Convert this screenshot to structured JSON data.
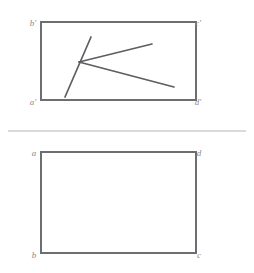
{
  "figure": {
    "background_color": "#ffffff",
    "line_color": "#6e6e72",
    "figure_color": "#5d5d62",
    "divider_color": "#b4b4b8",
    "label_color": "#8a8a8a"
  },
  "views": [
    {
      "name": "front-view",
      "label": "upper view",
      "rect": {
        "x": 41,
        "y": 22,
        "width": 155,
        "height": 78
      },
      "corner_labels": [
        {
          "key": "top_left",
          "text": "b'",
          "x": 33,
          "y": 24
        },
        {
          "key": "top_right",
          "text": "c'",
          "x": 198,
          "y": 24
        },
        {
          "key": "bottom_left",
          "text": "a'",
          "x": 33,
          "y": 103
        },
        {
          "key": "bottom_right",
          "text": "d'",
          "x": 198,
          "y": 103
        }
      ],
      "content_lines": [
        {
          "name": "stroke-diagonal",
          "x1": 91,
          "y1": 37,
          "x2": 65,
          "y2": 97
        },
        {
          "name": "stroke-upper-ray",
          "x1": 79,
          "y1": 62,
          "x2": 152,
          "y2": 44
        },
        {
          "name": "stroke-lower-ray",
          "x1": 79,
          "y1": 62,
          "x2": 174,
          "y2": 87
        }
      ]
    },
    {
      "name": "top-view",
      "label": "lower view",
      "rect": {
        "x": 41,
        "y": 152,
        "width": 155,
        "height": 101
      },
      "corner_labels": [
        {
          "key": "top_left",
          "text": "a",
          "x": 34,
          "y": 154
        },
        {
          "key": "top_right",
          "text": "d",
          "x": 199,
          "y": 154
        },
        {
          "key": "bottom_left",
          "text": "b",
          "x": 34,
          "y": 256
        },
        {
          "key": "bottom_right",
          "text": "c",
          "x": 199,
          "y": 256
        }
      ],
      "content_lines": []
    }
  ],
  "divider": {
    "name": "reference-line",
    "x1": 8,
    "y1": 131,
    "x2": 246,
    "y2": 131
  }
}
